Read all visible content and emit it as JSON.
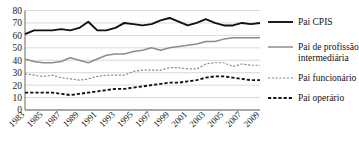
{
  "chart_data": {
    "type": "line",
    "title": "",
    "xlabel": "",
    "ylabel": "",
    "ylim": [
      0,
      80
    ],
    "ytick_step": 10,
    "grid": true,
    "legend_position": "right",
    "yticks": [
      "0",
      "10",
      "20",
      "30",
      "40",
      "50",
      "60",
      "70",
      "80"
    ],
    "x": [
      1983,
      1984,
      1985,
      1986,
      1987,
      1988,
      1989,
      1990,
      1991,
      1992,
      1993,
      1994,
      1995,
      1996,
      1997,
      1998,
      1999,
      2000,
      2001,
      2002,
      2003,
      2004,
      2005,
      2006,
      2007,
      2008,
      2009
    ],
    "xtick_labels": [
      "1983",
      "1985",
      "1987",
      "1989",
      "1991",
      "1993",
      "1995",
      "1997",
      "1999",
      "2001",
      "2003",
      "2005",
      "2007",
      "2009"
    ],
    "series": [
      {
        "name": "Pai CPIS",
        "style": "solid-thick-black",
        "color": "#111111",
        "values": [
          61,
          64,
          64,
          64,
          65,
          64,
          66,
          71,
          64,
          64,
          66,
          70,
          69,
          68,
          69,
          72,
          74,
          71,
          68,
          70,
          73,
          70,
          68,
          68,
          70,
          69,
          70
        ]
      },
      {
        "name": "Pai de profissão intermediária",
        "style": "solid-gray",
        "color": "#8c8c8c",
        "values": [
          41,
          39,
          38,
          38,
          39,
          42,
          40,
          38,
          41,
          44,
          45,
          45,
          47,
          48,
          50,
          48,
          50,
          51,
          52,
          53,
          55,
          55,
          57,
          58,
          58,
          58,
          58
        ]
      },
      {
        "name": "Pai funcionário",
        "style": "dotted-gray",
        "color": "#8c8c8c",
        "values": [
          29,
          28,
          27,
          28,
          26,
          25,
          24,
          25,
          27,
          28,
          28,
          28,
          31,
          32,
          32,
          32,
          34,
          34,
          33,
          33,
          37,
          38,
          38,
          35,
          37,
          36,
          36
        ]
      },
      {
        "name": "Pai operário",
        "style": "dashed-black",
        "color": "#111111",
        "values": [
          14,
          14,
          14,
          14,
          13,
          12,
          13,
          14,
          15,
          16,
          17,
          17,
          18,
          19,
          20,
          21,
          22,
          22,
          23,
          24,
          26,
          27,
          27,
          26,
          25,
          24,
          24
        ]
      }
    ]
  },
  "legend": {
    "items": [
      {
        "label": "Pai CPIS"
      },
      {
        "label": "Pai de profissão"
      },
      {
        "label": "intermediária"
      },
      {
        "label": "Pai funcionário"
      },
      {
        "label": "Pai operário"
      }
    ]
  }
}
